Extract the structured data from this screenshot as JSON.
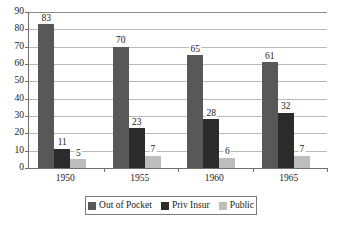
{
  "chart_data": {
    "type": "bar",
    "title": "",
    "subtitle": "",
    "xlabel": "",
    "ylabel": "",
    "categories": [
      "1950",
      "1955",
      "1960",
      "1965"
    ],
    "series": [
      {
        "name": "Out of Pocket",
        "color": "#585858",
        "values": [
          83,
          70,
          65,
          61
        ]
      },
      {
        "name": "Priv Insur",
        "color": "#2b2b2b",
        "values": [
          11,
          23,
          28,
          32
        ]
      },
      {
        "name": "Public",
        "color": "#bdbdbd",
        "values": [
          5,
          7,
          6,
          7
        ]
      }
    ],
    "ylim": [
      0,
      90
    ],
    "ytick_step": 10,
    "yticks": [
      0,
      10,
      20,
      30,
      40,
      50,
      60,
      70,
      80,
      90
    ],
    "ytick_labels": [
      "0",
      "10",
      "20",
      "30",
      "40",
      "50",
      "60",
      "70",
      "80",
      "90"
    ],
    "grid": true,
    "grid_axis": "y",
    "data_labels": true,
    "legend_position": "bottom"
  }
}
